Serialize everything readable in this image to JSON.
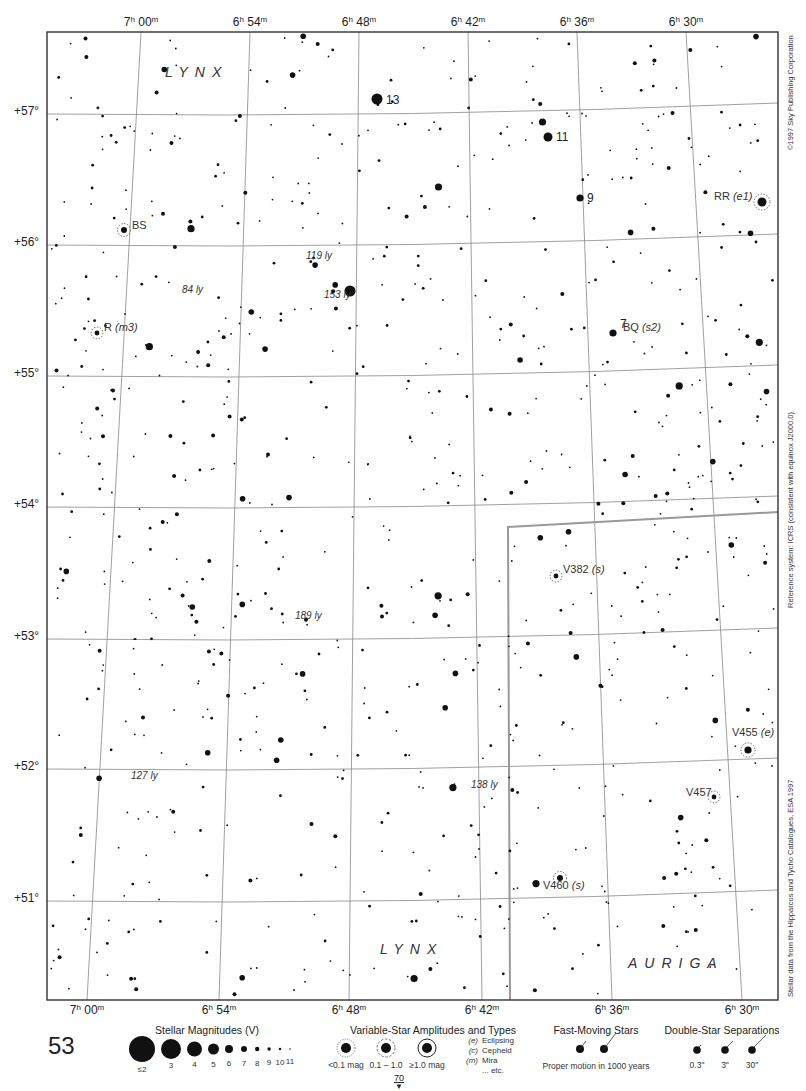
{
  "page": {
    "page_number": "53",
    "next_page": "70",
    "next_page_arrow": "▼"
  },
  "side_notes": {
    "copyright": "©1997 Sky Publishing Corporation",
    "reference_system": "Reference system: ICRS (consistent with equinox J2000.0)",
    "data_source": "Stellar data from the Hipparcos and Tycho Catalogues, ESA 1997"
  },
  "ra_labels_top": [
    {
      "h": "7",
      "m": "00",
      "x": 141
    },
    {
      "h": "6",
      "m": "54",
      "x": 250
    },
    {
      "h": "6",
      "m": "48",
      "x": 359
    },
    {
      "h": "6",
      "m": "42",
      "x": 468
    },
    {
      "h": "6",
      "m": "36",
      "x": 577
    },
    {
      "h": "6",
      "m": "30",
      "x": 686
    }
  ],
  "ra_labels_bottom": [
    {
      "h": "7",
      "m": "00",
      "x": 87
    },
    {
      "h": "6",
      "m": "54",
      "x": 219
    },
    {
      "h": "6",
      "m": "48",
      "x": 349
    },
    {
      "h": "6",
      "m": "42",
      "x": 482
    },
    {
      "h": "6",
      "m": "36",
      "x": 612
    },
    {
      "h": "6",
      "m": "30",
      "x": 742
    }
  ],
  "dec_labels": [
    {
      "text": "+57°",
      "y": 111
    },
    {
      "text": "+56°",
      "y": 242
    },
    {
      "text": "+55°",
      "y": 373
    },
    {
      "text": "+54°",
      "y": 504
    },
    {
      "text": "+53°",
      "y": 636
    },
    {
      "text": "+52°",
      "y": 766
    },
    {
      "text": "+51°",
      "y": 898
    }
  ],
  "constellations": [
    {
      "name": "LYNX",
      "x": 165,
      "y": 75
    },
    {
      "name": "LYNX",
      "x": 380,
      "y": 952
    },
    {
      "name": "AURIGA",
      "x": 628,
      "y": 966
    }
  ],
  "flamsteed_labels": [
    {
      "text": "13",
      "x": 386,
      "y": 94
    },
    {
      "text": "11",
      "x": 556,
      "y": 131
    },
    {
      "text": "9",
      "x": 587,
      "y": 192
    },
    {
      "text": "7",
      "x": 620,
      "y": 318
    }
  ],
  "variable_star_labels": [
    {
      "name": "BS",
      "type": "",
      "x": 132,
      "y": 226
    },
    {
      "name": "R",
      "type": "(m3)",
      "x": 104,
      "y": 328
    },
    {
      "name": "RR",
      "type": "(e1)",
      "x": 714,
      "y": 197
    },
    {
      "name": "BQ",
      "type": "(s2)",
      "x": 623,
      "y": 328
    },
    {
      "name": "V382",
      "type": "(s)",
      "x": 563,
      "y": 570
    },
    {
      "name": "V455",
      "type": "(e)",
      "x": 732,
      "y": 733
    },
    {
      "name": "V457",
      "type": "",
      "x": 686,
      "y": 793
    },
    {
      "name": "V460",
      "type": "(s)",
      "x": 543,
      "y": 886
    }
  ],
  "distance_labels": [
    {
      "text": "84 ly",
      "x": 182,
      "y": 291
    },
    {
      "text": "119 ly",
      "x": 306,
      "y": 257
    },
    {
      "text": "153 ly",
      "x": 324,
      "y": 296
    },
    {
      "text": "189 ly",
      "x": 295,
      "y": 617
    },
    {
      "text": "127 ly",
      "x": 131,
      "y": 777
    },
    {
      "text": "138 ly",
      "x": 471,
      "y": 786
    }
  ],
  "legend": {
    "magnitudes": {
      "title": "Stellar Magnitudes (V)",
      "entries": [
        {
          "label": "≤2",
          "r": 13
        },
        {
          "label": "3",
          "r": 10
        },
        {
          "label": "4",
          "r": 7.5
        },
        {
          "label": "5",
          "r": 5.5
        },
        {
          "label": "6",
          "r": 4
        },
        {
          "label": "7",
          "r": 3
        },
        {
          "label": "8",
          "r": 2.2
        },
        {
          "label": "9",
          "r": 1.7
        },
        {
          "label": "10",
          "r": 1.2
        },
        {
          "label": "11",
          "r": 0.8
        }
      ]
    },
    "variables": {
      "title": "Variable-Star Amplitudes and Types",
      "amplitudes": [
        "<0.1 mag",
        "0.1 – 1.0",
        "≥1.0 mag"
      ],
      "types": [
        {
          "code": "(e)",
          "name": "Eclipsing"
        },
        {
          "code": "(c)",
          "name": "Cepheid"
        },
        {
          "code": "(m)",
          "name": "Mira"
        },
        {
          "code": "",
          "name": "... etc."
        }
      ]
    },
    "fast_moving": {
      "title": "Fast-Moving Stars",
      "caption": "Proper motion in 1000 years"
    },
    "double_stars": {
      "title": "Double-Star Separations",
      "separations": [
        "0.3\"",
        "3\"",
        "30\""
      ]
    }
  },
  "chart_data": {
    "type": "scatter",
    "frame": {
      "left": 47,
      "top": 32,
      "right": 778,
      "bottom": 1000
    },
    "dec_range": [
      "+50.5°",
      "+57.7°"
    ],
    "ra_range": [
      "7h 04m",
      "6h 26m"
    ],
    "grid": true,
    "named_stars": [
      {
        "label": "13",
        "x": 377,
        "y": 99,
        "mag": 4
      },
      {
        "label": "11",
        "x": 548,
        "y": 137,
        "mag": 5
      },
      {
        "label": "9",
        "x": 580,
        "y": 198,
        "mag": 6
      },
      {
        "label": "7",
        "x": 613,
        "y": 333,
        "mag": 6
      },
      {
        "label": "RR (e1)",
        "x": 762,
        "y": 202,
        "mag": 5
      },
      {
        "label": "BS",
        "x": 124,
        "y": 230,
        "mag": 7
      },
      {
        "label": "R (m3)",
        "x": 97,
        "y": 333,
        "mag": 8
      },
      {
        "label": "V382 (s)",
        "x": 556,
        "y": 576,
        "mag": 8
      },
      {
        "label": "V455 (e)",
        "x": 748,
        "y": 750,
        "mag": 6
      },
      {
        "label": "V457",
        "x": 714,
        "y": 797,
        "mag": 8
      },
      {
        "label": "V460 (s)",
        "x": 560,
        "y": 878,
        "mag": 7
      },
      {
        "label": "153 ly",
        "x": 350,
        "y": 291,
        "mag": 4
      }
    ],
    "constellation_boundary": [
      [
        510,
        1000
      ],
      [
        508,
        527
      ],
      [
        778,
        512
      ]
    ]
  }
}
